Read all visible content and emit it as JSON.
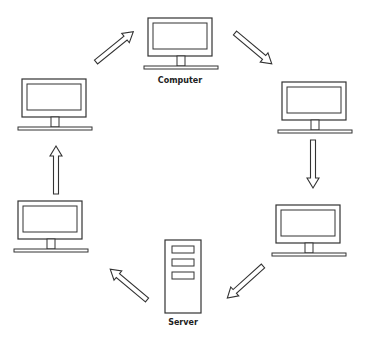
{
  "diagram": {
    "type": "ring network",
    "nodes": [
      {
        "id": "computer-top",
        "kind": "computer",
        "label": "Computer"
      },
      {
        "id": "computer-right-top",
        "kind": "computer",
        "label": ""
      },
      {
        "id": "computer-right-bottom",
        "kind": "computer",
        "label": ""
      },
      {
        "id": "server",
        "kind": "server",
        "label": "Server"
      },
      {
        "id": "computer-left-bottom",
        "kind": "computer",
        "label": ""
      },
      {
        "id": "computer-left-top",
        "kind": "computer",
        "label": ""
      }
    ],
    "edges": [
      {
        "from": "computer-left-top",
        "to": "computer-top"
      },
      {
        "from": "computer-top",
        "to": "computer-right-top"
      },
      {
        "from": "computer-right-top",
        "to": "computer-right-bottom"
      },
      {
        "from": "computer-right-bottom",
        "to": "server"
      },
      {
        "from": "server",
        "to": "computer-left-bottom"
      },
      {
        "from": "computer-left-bottom",
        "to": "computer-left-top"
      }
    ],
    "colors": {
      "stroke": "#333333",
      "fill": "#ffffff"
    }
  }
}
